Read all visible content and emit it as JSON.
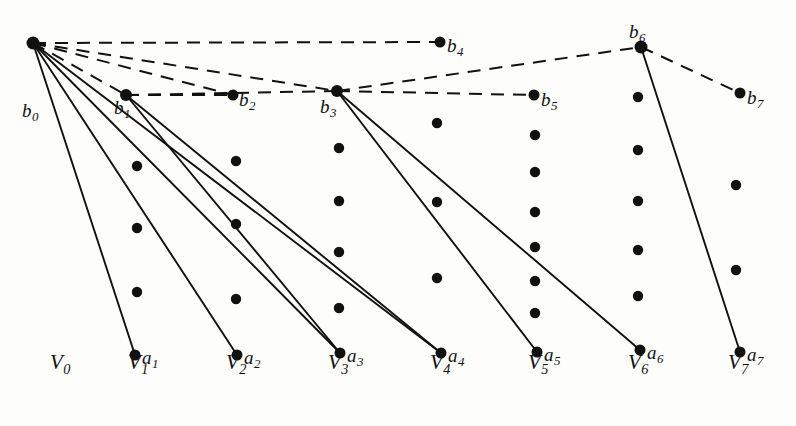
{
  "figure": {
    "width": 796,
    "height": 426,
    "background": "#fdfdfc",
    "ink_color": "#111111"
  },
  "columns": [
    {
      "name": "V0",
      "base": "V",
      "sub": "0",
      "x": 60,
      "label_x": 50,
      "label_y": 352
    },
    {
      "name": "V1",
      "base": "V",
      "sub": "1",
      "x": 140,
      "label_x": 128,
      "label_y": 352
    },
    {
      "name": "V2",
      "base": "V",
      "sub": "2",
      "x": 238,
      "label_x": 226,
      "label_y": 352
    },
    {
      "name": "V3",
      "base": "V",
      "sub": "3",
      "x": 340,
      "label_x": 328,
      "label_y": 352
    },
    {
      "name": "V4",
      "base": "V",
      "sub": "4",
      "x": 442,
      "label_x": 430,
      "label_y": 352
    },
    {
      "name": "V5",
      "base": "V",
      "sub": "5",
      "x": 540,
      "label_x": 528,
      "label_y": 352
    },
    {
      "name": "V6",
      "base": "V",
      "sub": "6",
      "x": 640,
      "label_x": 628,
      "label_y": 352
    },
    {
      "name": "V7",
      "base": "V",
      "sub": "7",
      "x": 740,
      "label_x": 728,
      "label_y": 352
    }
  ],
  "b_nodes": [
    {
      "id": "b0",
      "base": "b",
      "sub": "0",
      "x": 33,
      "y": 43,
      "r": 6.5,
      "label_x": 22,
      "label_y": 101
    },
    {
      "id": "b1",
      "base": "b",
      "sub": "1",
      "x": 126,
      "y": 95,
      "r": 6.0,
      "label_x": 114,
      "label_y": 98
    },
    {
      "id": "b2",
      "base": "b",
      "sub": "2",
      "x": 233,
      "y": 95,
      "r": 5.5,
      "label_x": 239,
      "label_y": 90
    },
    {
      "id": "b3",
      "base": "b",
      "sub": "3",
      "x": 337,
      "y": 91,
      "r": 6.0,
      "label_x": 320,
      "label_y": 97
    },
    {
      "id": "b4",
      "base": "b",
      "sub": "4",
      "x": 440,
      "y": 42,
      "r": 5.5,
      "label_x": 447,
      "label_y": 36
    },
    {
      "id": "b5",
      "base": "b",
      "sub": "5",
      "x": 534,
      "y": 95,
      "r": 5.5,
      "label_x": 541,
      "label_y": 90
    },
    {
      "id": "b6",
      "base": "b",
      "sub": "6",
      "x": 641,
      "y": 47,
      "r": 6.5,
      "label_x": 629,
      "label_y": 22
    },
    {
      "id": "b7",
      "base": "b",
      "sub": "7",
      "x": 740,
      "y": 93,
      "r": 5.5,
      "label_x": 747,
      "label_y": 88
    }
  ],
  "a_nodes": [
    {
      "id": "a1",
      "base": "a",
      "sub": "1",
      "x": 135,
      "y": 355,
      "r": 5.5,
      "label_x": 142,
      "label_y": 348
    },
    {
      "id": "a2",
      "base": "a",
      "sub": "2",
      "x": 237,
      "y": 355,
      "r": 5.5,
      "label_x": 244,
      "label_y": 348
    },
    {
      "id": "a3",
      "base": "a",
      "sub": "3",
      "x": 340,
      "y": 353,
      "r": 5.5,
      "label_x": 347,
      "label_y": 346
    },
    {
      "id": "a4",
      "base": "a",
      "sub": "4",
      "x": 441,
      "y": 353,
      "r": 5.5,
      "label_x": 448,
      "label_y": 346
    },
    {
      "id": "a5",
      "base": "a",
      "sub": "5",
      "x": 537,
      "y": 352,
      "r": 5.5,
      "label_x": 544,
      "label_y": 345
    },
    {
      "id": "a6",
      "base": "a",
      "sub": "6",
      "x": 640,
      "y": 350,
      "r": 5.5,
      "label_x": 647,
      "label_y": 343
    },
    {
      "id": "a7",
      "base": "a",
      "sub": "7",
      "x": 740,
      "y": 352,
      "r": 5.5,
      "label_x": 747,
      "label_y": 345
    }
  ],
  "interior_dots": [
    {
      "col": "V1",
      "x": 137,
      "y": 166,
      "r": 5.2
    },
    {
      "col": "V1",
      "x": 137,
      "y": 228,
      "r": 5.2
    },
    {
      "col": "V1",
      "x": 137,
      "y": 292,
      "r": 5.2
    },
    {
      "col": "V2",
      "x": 236,
      "y": 161,
      "r": 5.2
    },
    {
      "col": "V2",
      "x": 236,
      "y": 224,
      "r": 5.2
    },
    {
      "col": "V2",
      "x": 236,
      "y": 299,
      "r": 5.2
    },
    {
      "col": "V3",
      "x": 339,
      "y": 148,
      "r": 5.2
    },
    {
      "col": "V3",
      "x": 339,
      "y": 201,
      "r": 5.2
    },
    {
      "col": "V3",
      "x": 339,
      "y": 252,
      "r": 5.2
    },
    {
      "col": "V3",
      "x": 339,
      "y": 308,
      "r": 5.2
    },
    {
      "col": "V4",
      "x": 437,
      "y": 123,
      "r": 5.2
    },
    {
      "col": "V4",
      "x": 437,
      "y": 202,
      "r": 5.2
    },
    {
      "col": "V4",
      "x": 437,
      "y": 278,
      "r": 5.2
    },
    {
      "col": "V5",
      "x": 535,
      "y": 135,
      "r": 5.2
    },
    {
      "col": "V5",
      "x": 535,
      "y": 172,
      "r": 5.2
    },
    {
      "col": "V5",
      "x": 535,
      "y": 212,
      "r": 5.2
    },
    {
      "col": "V5",
      "x": 535,
      "y": 247,
      "r": 5.2
    },
    {
      "col": "V5",
      "x": 535,
      "y": 281,
      "r": 5.2
    },
    {
      "col": "V5",
      "x": 535,
      "y": 313,
      "r": 5.2
    },
    {
      "col": "V6",
      "x": 638,
      "y": 97,
      "r": 5.2
    },
    {
      "col": "V6",
      "x": 638,
      "y": 150,
      "r": 5.2
    },
    {
      "col": "V6",
      "x": 638,
      "y": 201,
      "r": 5.2
    },
    {
      "col": "V6",
      "x": 638,
      "y": 250,
      "r": 5.2
    },
    {
      "col": "V6",
      "x": 638,
      "y": 296,
      "r": 5.2
    },
    {
      "col": "V7",
      "x": 736,
      "y": 185,
      "r": 5.2
    },
    {
      "col": "V7",
      "x": 736,
      "y": 270,
      "r": 5.2
    }
  ],
  "solid_edges": [
    {
      "from": "b0",
      "to": "a1",
      "x1": 33,
      "y1": 43,
      "x2": 135,
      "y2": 355
    },
    {
      "from": "b0",
      "to": "a2",
      "x1": 33,
      "y1": 43,
      "x2": 237,
      "y2": 355
    },
    {
      "from": "b0",
      "to": "a3",
      "x1": 33,
      "y1": 43,
      "x2": 340,
      "y2": 353
    },
    {
      "from": "b0",
      "to": "a4",
      "x1": 33,
      "y1": 43,
      "x2": 441,
      "y2": 353
    },
    {
      "from": "b1",
      "to": "a3",
      "x1": 126,
      "y1": 95,
      "x2": 340,
      "y2": 353
    },
    {
      "from": "b1",
      "to": "a4",
      "x1": 126,
      "y1": 95,
      "x2": 441,
      "y2": 353
    },
    {
      "from": "b3",
      "to": "a5",
      "x1": 337,
      "y1": 91,
      "x2": 537,
      "y2": 352
    },
    {
      "from": "b3",
      "to": "a6",
      "x1": 337,
      "y1": 91,
      "x2": 640,
      "y2": 350
    },
    {
      "from": "b6",
      "to": "a7",
      "x1": 641,
      "y1": 47,
      "x2": 740,
      "y2": 352
    }
  ],
  "dashed_edges": [
    {
      "from": "b0",
      "to": "b1",
      "x1": 33,
      "y1": 43,
      "x2": 126,
      "y2": 95
    },
    {
      "from": "b0",
      "to": "b2",
      "x1": 33,
      "y1": 43,
      "x2": 233,
      "y2": 95
    },
    {
      "from": "b0",
      "to": "b3",
      "x1": 33,
      "y1": 43,
      "x2": 337,
      "y2": 91
    },
    {
      "from": "b0",
      "to": "b4",
      "x1": 33,
      "y1": 43,
      "x2": 440,
      "y2": 42
    },
    {
      "from": "b1",
      "to": "b2",
      "x1": 126,
      "y1": 95,
      "x2": 233,
      "y2": 95
    },
    {
      "from": "b1",
      "to": "b3",
      "x1": 126,
      "y1": 95,
      "x2": 337,
      "y2": 91
    },
    {
      "from": "b3",
      "to": "b5",
      "x1": 337,
      "y1": 91,
      "x2": 534,
      "y2": 95
    },
    {
      "from": "b3",
      "to": "b6",
      "x1": 337,
      "y1": 91,
      "x2": 641,
      "y2": 47
    },
    {
      "from": "b6",
      "to": "b7",
      "x1": 641,
      "y1": 47,
      "x2": 740,
      "y2": 93
    }
  ]
}
